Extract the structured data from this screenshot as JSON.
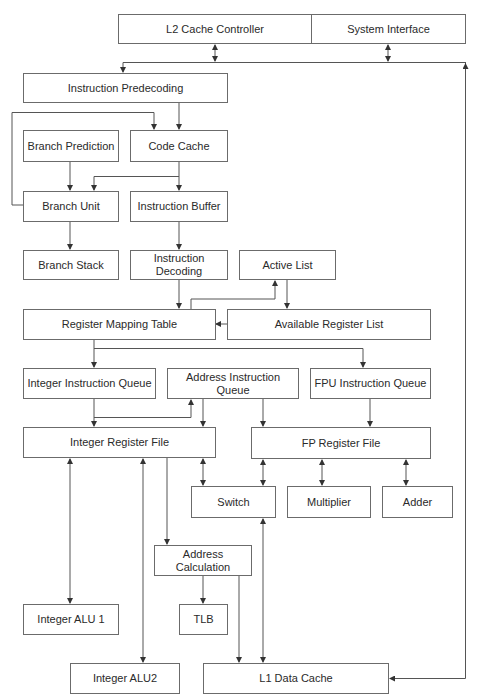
{
  "colors": {
    "line": "#555555",
    "border": "#6b6b6b",
    "text": "#2a2a2a"
  },
  "blocks": {
    "l2_cache_controller": "L2 Cache Controller",
    "system_interface": "System Interface",
    "instruction_predecoding": "Instruction Predecoding",
    "branch_prediction": "Branch Prediction",
    "code_cache": "Code Cache",
    "branch_unit": "Branch Unit",
    "instruction_buffer": "Instruction Buffer",
    "branch_stack": "Branch Stack",
    "instruction_decoding": "Instruction Decoding",
    "active_list": "Active List",
    "register_mapping_table": "Register Mapping Table",
    "available_register_list": "Available Register List",
    "integer_instruction_queue": "Integer Instruction Queue",
    "address_instruction_queue": "Address Instruction Queue",
    "fpu_instruction_queue": "FPU Instruction Queue",
    "integer_register_file": "Integer Register File",
    "fp_register_file": "FP Register File",
    "switch": "Switch",
    "multiplier": "Multiplier",
    "adder": "Adder",
    "address_calculation": "Address Calculation",
    "integer_alu_1": "Integer ALU 1",
    "tlb": "TLB",
    "integer_alu_2": "Integer ALU2",
    "l1_data_cache": "L1 Data Cache"
  }
}
